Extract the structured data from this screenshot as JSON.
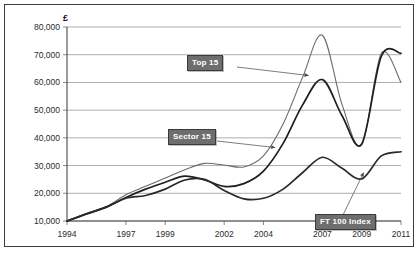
{
  "chart_data": {
    "type": "line",
    "title": "",
    "xlabel": "",
    "ylabel": "£",
    "y_unit_symbol": "£",
    "grid": true,
    "legend_position": "inline-callouts",
    "xlim": [
      1994,
      2011
    ],
    "ylim": [
      10000,
      80000
    ],
    "x_ticks": [
      1994,
      1997,
      1999,
      2002,
      2004,
      2007,
      2009,
      2011
    ],
    "x_tick_labels": [
      "1994",
      "1997",
      "1999",
      "2002",
      "2004",
      "2007",
      "2009",
      "2011"
    ],
    "y_ticks": [
      10000,
      20000,
      30000,
      40000,
      50000,
      60000,
      70000,
      80000
    ],
    "y_tick_labels": [
      "10,000",
      "20,000",
      "30,000",
      "40,000",
      "50,000",
      "60,000",
      "70,000",
      "80,000"
    ],
    "x": [
      1994,
      1995,
      1996,
      1997,
      1998,
      1999,
      2000,
      2001,
      2002,
      2003,
      2004,
      2005,
      2006,
      2007,
      2008,
      2009,
      2010,
      2011
    ],
    "series": [
      {
        "name": "Top 15",
        "color": "#6b6b6b",
        "width": 1.1,
        "values": [
          10000,
          12800,
          15200,
          19500,
          22500,
          25500,
          28500,
          30800,
          30200,
          29500,
          33500,
          45000,
          62000,
          77000,
          52000,
          37500,
          70500,
          60000
        ]
      },
      {
        "name": "Sector 15",
        "color": "#1f1f1f",
        "width": 1.7,
        "values": [
          10000,
          12500,
          15000,
          18500,
          21500,
          24000,
          26200,
          24800,
          22500,
          23500,
          28000,
          38000,
          52000,
          61000,
          48000,
          37800,
          69500,
          70500
        ]
      },
      {
        "name": "FT 100 Index",
        "color": "#2a2a2a",
        "width": 1.7,
        "values": [
          10000,
          12600,
          15000,
          18200,
          19200,
          21500,
          24800,
          25000,
          21000,
          18000,
          18200,
          21500,
          27500,
          33000,
          29000,
          25200,
          33500,
          35000
        ]
      }
    ],
    "annotations": [
      {
        "label": "Top 15",
        "target_x": 2006.3,
        "target_y": 62500
      },
      {
        "label": "Sector 15",
        "target_x": 2004.6,
        "target_y": 36500
      },
      {
        "label": "FT 100 Index",
        "target_x": 2009.1,
        "target_y": 27500
      }
    ]
  }
}
